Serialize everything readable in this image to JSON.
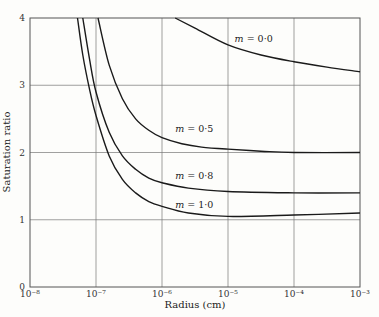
{
  "top_caption": "σ_R(r)  ...  r  ...  ...",
  "chart_data": {
    "type": "line",
    "title": "",
    "xlabel": "Radius (cm)",
    "ylabel": "Saturation ratio",
    "xscale": "log",
    "xlim": [
      1e-08,
      0.001
    ],
    "ylim": [
      0,
      4
    ],
    "x_ticks": [
      "10⁻⁸",
      "10⁻⁷",
      "10⁻⁶",
      "10⁻⁵",
      "10⁻⁴",
      "10⁻³"
    ],
    "y_ticks": [
      "0",
      "1",
      "2",
      "3",
      "4"
    ],
    "grid": true,
    "series": [
      {
        "name": "m = 0·0",
        "label": "m = 0·0",
        "points": [
          [
            -5.8,
            4.0
          ],
          [
            -5.5,
            3.85
          ],
          [
            -5.0,
            3.6
          ],
          [
            -4.5,
            3.45
          ],
          [
            -4.0,
            3.35
          ],
          [
            -3.5,
            3.27
          ],
          [
            -3.0,
            3.2
          ]
        ]
      },
      {
        "name": "m = 0·5",
        "label": "m = 0·5",
        "points": [
          [
            -6.97,
            4.0
          ],
          [
            -6.8,
            3.3
          ],
          [
            -6.6,
            2.8
          ],
          [
            -6.4,
            2.5
          ],
          [
            -6.2,
            2.33
          ],
          [
            -6.0,
            2.22
          ],
          [
            -5.7,
            2.13
          ],
          [
            -5.4,
            2.08
          ],
          [
            -5.0,
            2.05
          ],
          [
            -4.5,
            2.02
          ],
          [
            -4.0,
            2.0
          ],
          [
            -3.0,
            2.0
          ]
        ]
      },
      {
        "name": "m = 0·8",
        "label": "m = 0·8",
        "points": [
          [
            -7.2,
            4.0
          ],
          [
            -7.1,
            3.4
          ],
          [
            -7.0,
            2.9
          ],
          [
            -6.8,
            2.3
          ],
          [
            -6.6,
            1.95
          ],
          [
            -6.4,
            1.75
          ],
          [
            -6.2,
            1.62
          ],
          [
            -6.0,
            1.55
          ],
          [
            -5.6,
            1.47
          ],
          [
            -5.0,
            1.42
          ],
          [
            -4.0,
            1.4
          ],
          [
            -3.0,
            1.4
          ]
        ]
      },
      {
        "name": "m = 1·0",
        "label": "m = 1·0",
        "points": [
          [
            -7.28,
            4.0
          ],
          [
            -7.2,
            3.45
          ],
          [
            -7.1,
            2.95
          ],
          [
            -7.0,
            2.55
          ],
          [
            -6.8,
            1.95
          ],
          [
            -6.6,
            1.6
          ],
          [
            -6.4,
            1.4
          ],
          [
            -6.2,
            1.27
          ],
          [
            -6.0,
            1.2
          ],
          [
            -5.6,
            1.1
          ],
          [
            -5.0,
            1.05
          ],
          [
            -4.0,
            1.07
          ],
          [
            -3.0,
            1.1
          ]
        ]
      }
    ],
    "annotations": [
      {
        "text": "m = 0·0",
        "x": -4.9,
        "y": 3.65
      },
      {
        "text": "m = 0·5",
        "x": -5.8,
        "y": 2.3
      },
      {
        "text": "m = 0·8",
        "x": -5.8,
        "y": 1.6
      },
      {
        "text": "m = 1·0",
        "x": -5.8,
        "y": 1.18
      }
    ]
  }
}
